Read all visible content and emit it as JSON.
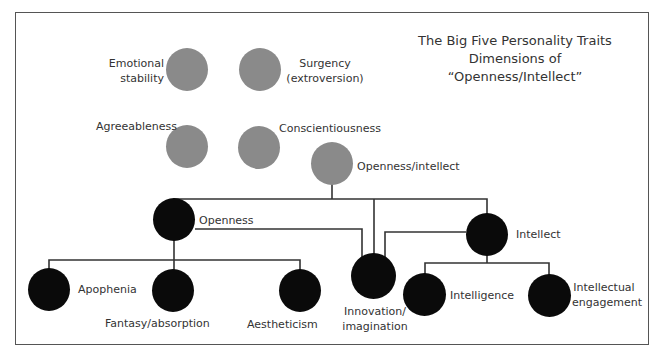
{
  "title": {
    "line1": "The Big Five Personality Traits",
    "line2": "Dimensions of “Openness/Intellect”"
  },
  "colors": {
    "big_five_node": "#8a8a8a",
    "subdimension_node": "#0a0a0a",
    "line": "#333333"
  },
  "big_five": [
    {
      "id": "emotional-stability",
      "line1": "Emotional",
      "line2": "stability"
    },
    {
      "id": "surgency",
      "line1": "Surgency",
      "line2": "(extroversion)"
    },
    {
      "id": "agreeableness",
      "label": "Agreeableness"
    },
    {
      "id": "conscientiousness",
      "label": "Conscientiousness"
    },
    {
      "id": "openness-intellect",
      "label": "Openness/intellect"
    }
  ],
  "aspects": [
    {
      "id": "openness",
      "label": "Openness"
    },
    {
      "id": "intellect",
      "label": "Intellect"
    }
  ],
  "facets": [
    {
      "id": "apophenia",
      "label": "Apophenia",
      "parent": "openness"
    },
    {
      "id": "fantasy-absorption",
      "label": "Fantasy/absorption",
      "parent": "openness"
    },
    {
      "id": "aestheticism",
      "label": "Aestheticism",
      "parent": "openness"
    },
    {
      "id": "innovation-imagination",
      "line1": "Innovation/",
      "line2": "imagination",
      "parent": "openness, intellect"
    },
    {
      "id": "intelligence",
      "label": "Intelligence",
      "parent": "intellect"
    },
    {
      "id": "intellectual-engagement",
      "line1": "Intellectual",
      "line2": "engagement",
      "parent": "intellect"
    }
  ]
}
